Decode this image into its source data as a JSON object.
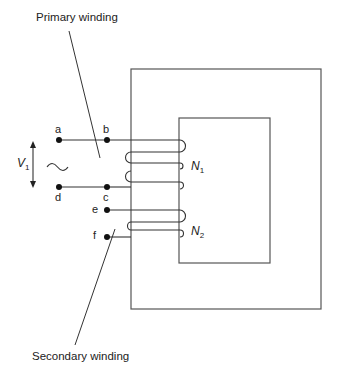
{
  "diagram": {
    "type": "transformer-schematic",
    "labels": {
      "primary_winding": "Primary winding",
      "secondary_winding": "Secondary winding",
      "voltage_symbol": "V",
      "voltage_sub": "1",
      "ac_source": "~",
      "primary_turns_symbol": "N",
      "primary_turns_sub": "1",
      "secondary_turns_symbol": "N",
      "secondary_turns_sub": "2"
    },
    "terminals": [
      "a",
      "b",
      "c",
      "d",
      "e",
      "f"
    ],
    "terminal_labels": {
      "a": "a",
      "b": "b",
      "c": "c",
      "d": "d",
      "e": "e",
      "f": "f"
    },
    "core": {
      "shape": "rectangular-core",
      "stroke": "#555555"
    },
    "line_color": "#333333"
  }
}
